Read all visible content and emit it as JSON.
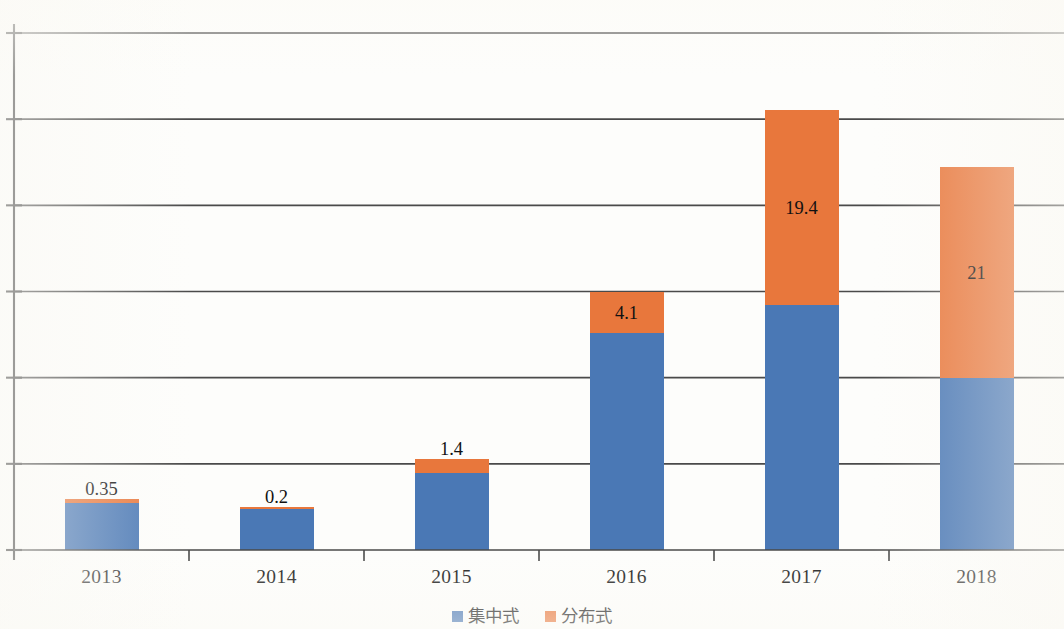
{
  "chart_data": {
    "type": "bar",
    "stacked": true,
    "title": "",
    "subtitle": "",
    "xlabel": "",
    "ylabel": "",
    "categories": [
      "2013",
      "2014",
      "2015",
      "2016",
      "2017",
      "2018"
    ],
    "series": [
      {
        "name": "集中式",
        "color": "#4a78b5",
        "values": [
          4.7,
          4.1,
          7.7,
          21.7,
          24.5,
          17.2
        ],
        "labels": [
          "",
          "",
          "",
          "",
          "",
          ""
        ]
      },
      {
        "name": "分布式",
        "color": "#e8773c",
        "values": [
          0.35,
          0.2,
          1.4,
          4.1,
          19.4,
          21
        ],
        "labels": [
          "0.35",
          "0.2",
          "1.4",
          "4.1",
          "19.4",
          "21"
        ]
      }
    ],
    "ylim": [
      0,
      52
    ],
    "ytick_values": [
      0,
      8.6,
      17.2,
      25.8,
      34.4,
      43,
      51.6
    ],
    "ytick_labels": [
      "",
      "",
      "",
      "",
      "",
      "",
      ""
    ],
    "grid": true,
    "legend_position": "bottom"
  },
  "legend": {
    "entries": [
      {
        "label": "集中式",
        "color": "#4a78b5"
      },
      {
        "label": "分布式",
        "color": "#e8773c"
      }
    ]
  },
  "axis": {
    "x_tick_labels": [
      "2013",
      "2014",
      "2015",
      "2016",
      "2017",
      "2018"
    ],
    "y_tick_labels": [
      "",
      "",
      "",
      "",
      "",
      "",
      ""
    ]
  }
}
